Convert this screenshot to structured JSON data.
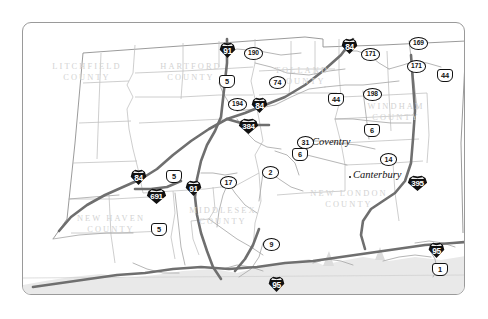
{
  "map": {
    "title": "Connecticut Highway Map",
    "frame": {
      "border_color": "#9a9a9a",
      "background": "#ffffff"
    },
    "palette": {
      "county_label": "#d3d3d3",
      "county_boundary": "#b9b9b9",
      "state_outline": "#8e8e8e",
      "major_highway": "#6e6e6e",
      "minor_road": "#a8a8a8",
      "water_shading": "#e4e4e4",
      "shield_interstate_fill": "#111111",
      "shield_route_fill": "#ffffff"
    },
    "counties": [
      {
        "name": "LITCHFIELD",
        "line2": "COUNTY",
        "x": 14,
        "y": 38
      },
      {
        "name": "HARTFORD",
        "line2": "COUNTY",
        "x": 122,
        "y": 38
      },
      {
        "name": "TOLLAND",
        "line2": "COUNTY",
        "x": 236,
        "y": 42
      },
      {
        "name": "WINDHAM",
        "line2": "COUNTY",
        "x": 326,
        "y": 78
      },
      {
        "name": "NEW HAVEN",
        "line2": "COUNTY",
        "x": 34,
        "y": 190
      },
      {
        "name": "MIDDLESEX",
        "line2": "COUNTY",
        "x": 152,
        "y": 182
      },
      {
        "name": "NEW LONDON",
        "line2": "COUNTY",
        "x": 268,
        "y": 165
      }
    ],
    "cities": [
      {
        "name": "Coventry",
        "x": 289,
        "y": 113,
        "dot_x": 285,
        "dot_y": 120
      },
      {
        "name": "Canterbury",
        "x": 330,
        "y": 146,
        "dot_x": 326,
        "dot_y": 153
      }
    ],
    "shields": [
      {
        "type": "interstate",
        "number": "91",
        "x": 196,
        "y": 19
      },
      {
        "type": "interstate",
        "number": "84",
        "x": 318,
        "y": 15
      },
      {
        "type": "interstate",
        "number": "84",
        "x": 228,
        "y": 74
      },
      {
        "type": "interstate",
        "number": "84",
        "x": 107,
        "y": 146
      },
      {
        "type": "interstate",
        "number": "91",
        "x": 162,
        "y": 157
      },
      {
        "type": "interstate",
        "number": "691",
        "x": 123,
        "y": 165,
        "wide": true
      },
      {
        "type": "interstate",
        "number": "384",
        "x": 215,
        "y": 95,
        "wide": true
      },
      {
        "type": "interstate",
        "number": "395",
        "x": 384,
        "y": 152,
        "wide": true
      },
      {
        "type": "interstate",
        "number": "95",
        "x": 405,
        "y": 219
      },
      {
        "type": "interstate",
        "number": "95",
        "x": 245,
        "y": 253
      },
      {
        "type": "us",
        "number": "5",
        "x": 196,
        "y": 52
      },
      {
        "type": "us",
        "number": "5",
        "x": 143,
        "y": 147
      },
      {
        "type": "us",
        "number": "5",
        "x": 128,
        "y": 200
      },
      {
        "type": "us",
        "number": "6",
        "x": 269,
        "y": 125
      },
      {
        "type": "us",
        "number": "6",
        "x": 341,
        "y": 101
      },
      {
        "type": "us",
        "number": "44",
        "x": 305,
        "y": 70
      },
      {
        "type": "us",
        "number": "44",
        "x": 414,
        "y": 46
      },
      {
        "type": "us",
        "number": "1",
        "x": 409,
        "y": 240
      },
      {
        "type": "state",
        "number": "190",
        "x": 221,
        "y": 24,
        "w3": true
      },
      {
        "type": "state",
        "number": "74",
        "x": 246,
        "y": 53
      },
      {
        "type": "state",
        "number": "194",
        "x": 205,
        "y": 75,
        "w3": true
      },
      {
        "type": "state",
        "number": "171",
        "x": 338,
        "y": 25,
        "w3": true
      },
      {
        "type": "state",
        "number": "171",
        "x": 384,
        "y": 37,
        "w3": true
      },
      {
        "type": "state",
        "number": "169",
        "x": 386,
        "y": 14,
        "w3": true
      },
      {
        "type": "state",
        "number": "198",
        "x": 340,
        "y": 65,
        "w3": true
      },
      {
        "type": "state",
        "number": "31",
        "x": 274,
        "y": 113
      },
      {
        "type": "state",
        "number": "14",
        "x": 357,
        "y": 130
      },
      {
        "type": "state",
        "number": "17",
        "x": 197,
        "y": 153
      },
      {
        "type": "state",
        "number": "2",
        "x": 239,
        "y": 143
      },
      {
        "type": "state",
        "number": "9",
        "x": 240,
        "y": 215
      }
    ]
  }
}
